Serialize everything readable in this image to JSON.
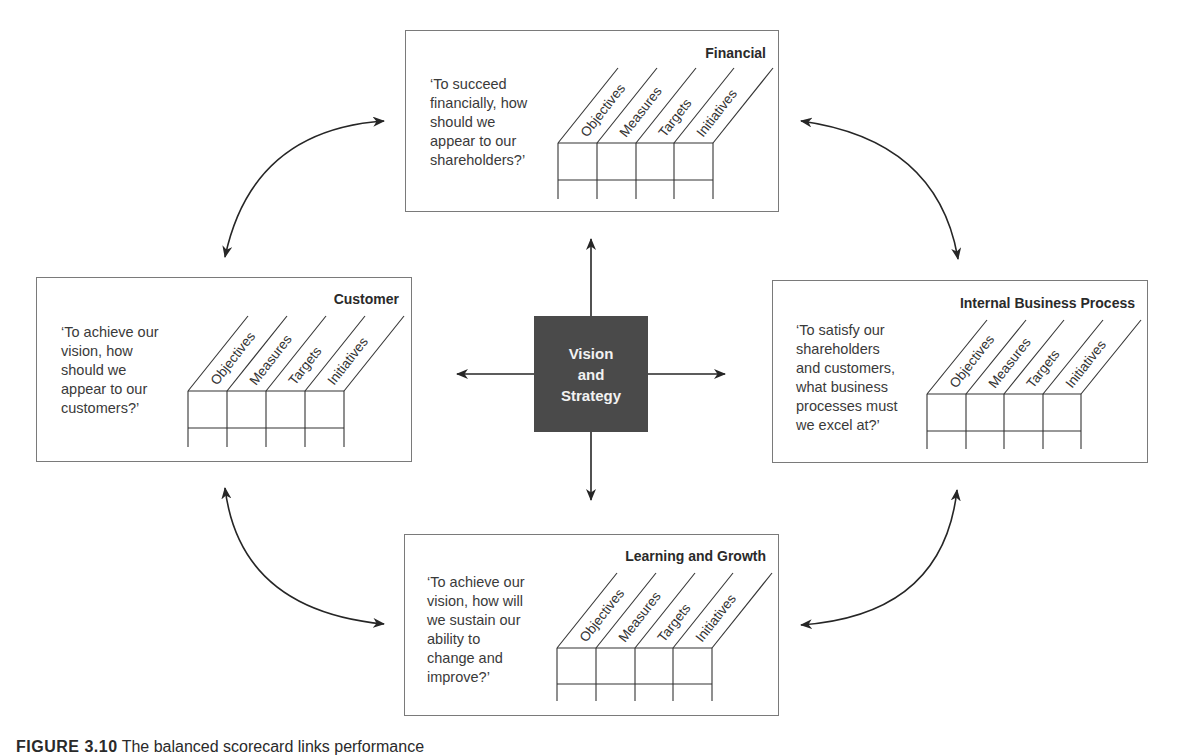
{
  "diagram": {
    "center": {
      "label": "Vision\nand\nStrategy",
      "fill": "#4a4a4a"
    },
    "column_headers": [
      "Objectives",
      "Measures",
      "Targets",
      "Initiatives"
    ],
    "perspectives": [
      {
        "id": "financial",
        "title": "Financial",
        "question": "‘To succeed\nfinancially, how\nshould we\nappear to our\nshareholders?’"
      },
      {
        "id": "customer",
        "title": "Customer",
        "question": "‘To achieve our\nvision, how\nshould we\nappear to our\ncustomers?’"
      },
      {
        "id": "internal",
        "title": "Internal Business Process",
        "question": "‘To satisfy our\nshareholders\nand customers,\nwhat business\nprocesses must\nwe excel at?’"
      },
      {
        "id": "learning",
        "title": "Learning and Growth",
        "question": "‘To achieve our\nvision, how will\nwe sustain our\nability to\nchange and\nimprove?’"
      }
    ],
    "connections": [
      {
        "from": "center",
        "to": "financial",
        "type": "straight-arrow"
      },
      {
        "from": "center",
        "to": "customer",
        "type": "straight-arrow"
      },
      {
        "from": "center",
        "to": "internal",
        "type": "straight-arrow"
      },
      {
        "from": "center",
        "to": "learning",
        "type": "straight-arrow"
      },
      {
        "from": "financial",
        "to": "customer",
        "type": "curved-double-arrow"
      },
      {
        "from": "financial",
        "to": "internal",
        "type": "curved-double-arrow"
      },
      {
        "from": "customer",
        "to": "learning",
        "type": "curved-double-arrow"
      },
      {
        "from": "internal",
        "to": "learning",
        "type": "curved-double-arrow"
      }
    ]
  },
  "caption": {
    "label": "FIGURE 3.10",
    "text": "The balanced scorecard links performance"
  }
}
